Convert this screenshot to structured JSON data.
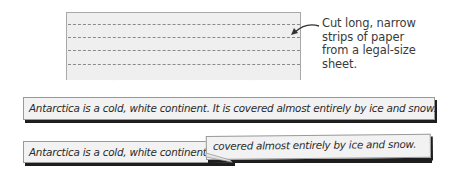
{
  "figure": {
    "paper_sheet": {
      "description": "legal-size sheet with dashed cut lines",
      "dashed_line_count": 4,
      "colors": {
        "paper": "#efefef",
        "border": "#a8a8a8",
        "dash": "#8a8a8a"
      }
    },
    "callout": {
      "lines": [
        "Cut long, narrow",
        "strips of paper",
        "from a legal-size",
        "sheet."
      ],
      "arrow_icon": "curved-arrow-left"
    },
    "strips": [
      {
        "text": "Antarctica is a cold, white continent. It is covered almost entirely by ice and snow."
      },
      {
        "text": "Antarctica is a cold, white continent"
      },
      {
        "text": "covered almost entirely by ice and snow.",
        "folded_over": true
      }
    ],
    "colors": {
      "strip_fill": "#f2f2f2",
      "strip_shadow": "#1e1e1e",
      "text": "#2b2b2b"
    }
  }
}
